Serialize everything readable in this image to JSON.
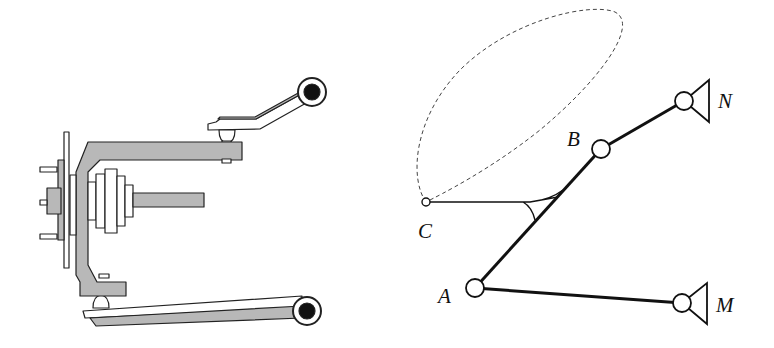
{
  "figure": {
    "left_panel": {
      "description": "Double-wishbone suspension: wheel hub, upright (knuckle), drive shaft, upper and lower control arms",
      "colors": {
        "fill": "#b8b8b8",
        "stroke": "#222222",
        "pivot": "#111111"
      }
    },
    "right_panel": {
      "description": "Four-bar linkage equivalent with coupler point trajectory",
      "labels": {
        "A": "A",
        "B": "B",
        "C": "C",
        "M": "M",
        "N": "N"
      }
    }
  }
}
